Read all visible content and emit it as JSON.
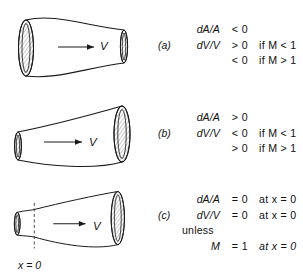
{
  "figure": {
    "background_color": "#ffffff",
    "line_color": "#1a1a1a",
    "panels": [
      {
        "tag": "(a)",
        "duct_shape": "converging-nozzle",
        "flow_arrow_label": "V",
        "rows": [
          {
            "lhs": "dA/A",
            "rel": "< 0",
            "cond": ""
          },
          {
            "lhs": "dV/V",
            "rel": "> 0",
            "cond": "if M < 1"
          },
          {
            "lhs": "",
            "rel": "< 0",
            "cond": "if M > 1"
          }
        ]
      },
      {
        "tag": "(b)",
        "duct_shape": "diverging-diffuser",
        "flow_arrow_label": "V",
        "rows": [
          {
            "lhs": "dA/A",
            "rel": "> 0",
            "cond": ""
          },
          {
            "lhs": "dV/V",
            "rel": "< 0",
            "cond": "if M < 1"
          },
          {
            "lhs": "",
            "rel": "> 0",
            "cond": "if M > 1"
          }
        ]
      },
      {
        "tag": "(c)",
        "duct_shape": "converging-diverging-throat",
        "flow_arrow_label": "V",
        "throat_label": "x = 0",
        "rows": [
          {
            "lhs": "dA/A",
            "rel": "= 0",
            "cond": "at x = 0"
          },
          {
            "lhs": "dV/V",
            "rel": "= 0",
            "cond": "at x = 0"
          }
        ],
        "unless_label": "unless",
        "final_row": {
          "lhs": "M",
          "rel": "= 1",
          "cond": "at x = 0"
        }
      }
    ]
  }
}
